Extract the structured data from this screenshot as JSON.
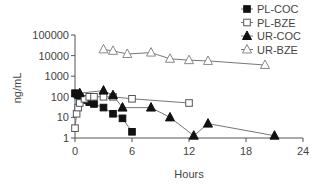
{
  "chart_data": {
    "type": "line",
    "title": "",
    "xlabel": "Hours",
    "ylabel": "ng/mL",
    "xlim": [
      0,
      24
    ],
    "ylim": [
      1,
      100000
    ],
    "yscale": "log",
    "xticks": [
      0,
      6,
      12,
      18,
      24
    ],
    "yticks": [
      1,
      10,
      100,
      1000,
      10000,
      100000
    ],
    "ytick_labels": [
      "1",
      "10",
      "100",
      "1000",
      "10000",
      "100000"
    ],
    "grid": false,
    "legend_position": "top-right",
    "series": [
      {
        "name": "PL-COC",
        "marker": "filled-square",
        "x": [
          0,
          0.17,
          0.33,
          0.5,
          0.75,
          1,
          1.5,
          2,
          3,
          4,
          5,
          6
        ],
        "y": [
          150,
          140,
          120,
          100,
          80,
          70,
          55,
          45,
          30,
          15,
          9,
          2
        ]
      },
      {
        "name": "PL-BZE",
        "marker": "open-square",
        "x": [
          0,
          0.17,
          0.33,
          0.5,
          1,
          1.5,
          2,
          3,
          4,
          6,
          12
        ],
        "y": [
          3,
          15,
          30,
          50,
          80,
          100,
          100,
          100,
          100,
          80,
          50
        ]
      },
      {
        "name": "UR-COC",
        "marker": "filled-triangle",
        "x": [
          0.5,
          3,
          4,
          5,
          8,
          10,
          12.5,
          14,
          21
        ],
        "y": [
          150,
          200,
          120,
          30,
          30,
          10,
          1.3,
          5,
          1.3
        ]
      },
      {
        "name": "UR-BZE",
        "marker": "open-triangle",
        "x": [
          3,
          4,
          5.5,
          8,
          10,
          12,
          14,
          20
        ],
        "y": [
          20000,
          17000,
          12000,
          14000,
          7000,
          6000,
          5500,
          3500
        ]
      }
    ]
  },
  "legend": {
    "items": [
      {
        "label": "PL-COC"
      },
      {
        "label": "PL-BZE"
      },
      {
        "label": "UR-COC"
      },
      {
        "label": "UR-BZE"
      }
    ]
  },
  "axes": {
    "xlabel": "Hours",
    "ylabel": "ng/mL"
  }
}
